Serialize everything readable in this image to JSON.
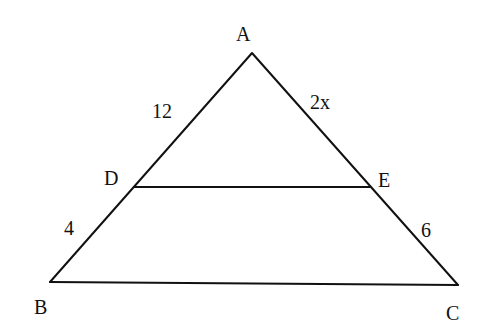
{
  "diagram": {
    "type": "triangle-with-parallel-segment",
    "colors": {
      "line": "#111111",
      "background": "#ffffff"
    },
    "vertices": {
      "A": {
        "label": "A"
      },
      "B": {
        "label": "B"
      },
      "C": {
        "label": "C"
      },
      "D": {
        "label": "D"
      },
      "E": {
        "label": "E"
      }
    },
    "segments": {
      "AD": {
        "label": "12"
      },
      "DB": {
        "label": "4"
      },
      "AE": {
        "label": "2x"
      },
      "EC": {
        "label": "6"
      }
    }
  }
}
